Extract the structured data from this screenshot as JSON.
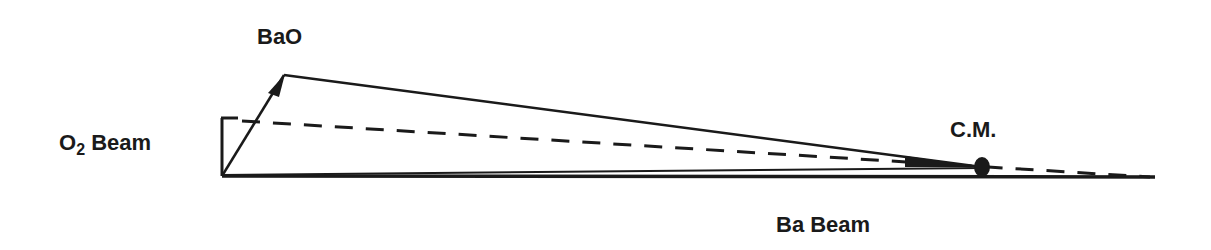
{
  "diagram": {
    "type": "Newton velocity diagram",
    "labels": {
      "product": "BaO",
      "o2_beam": "O",
      "o2_subscript": "2",
      "o2_beam_suffix": " Beam",
      "center_of_mass": "C.M.",
      "ba_beam": "Ba Beam"
    },
    "colors": {
      "ink": "#1a1a1a",
      "background": "#ffffff"
    }
  }
}
